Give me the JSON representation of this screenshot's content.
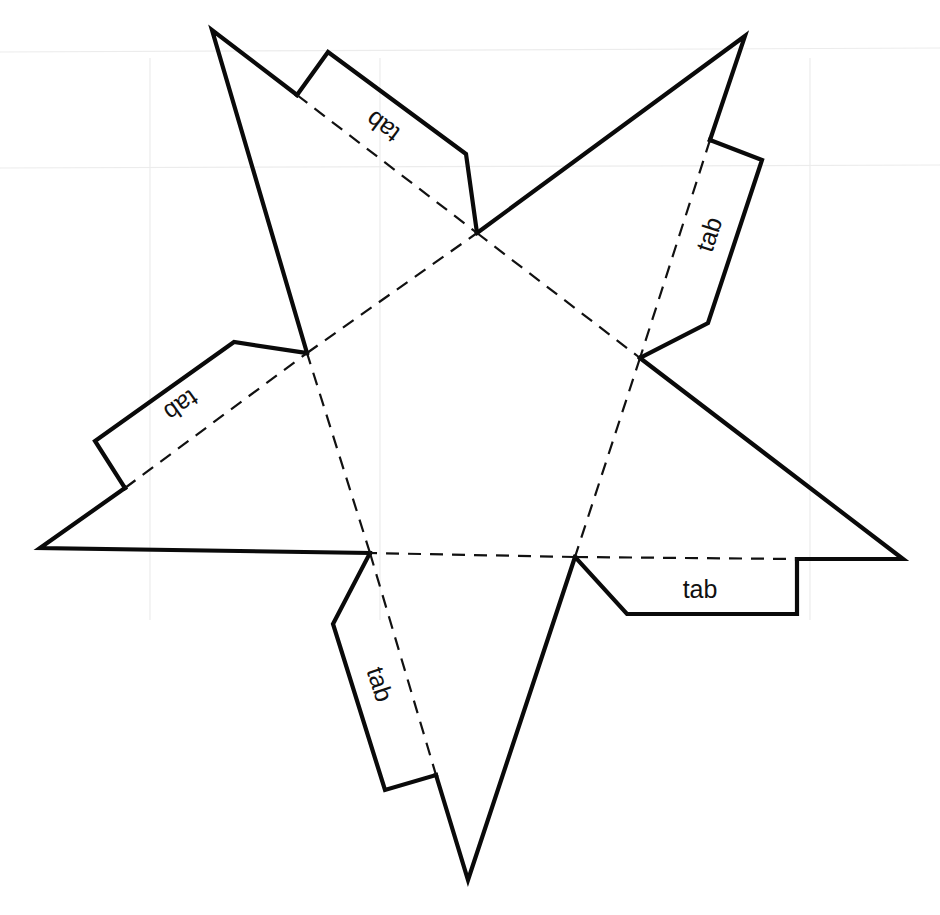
{
  "figure": {
    "shape": "pentagonal-pyramid-net",
    "base_faces": 1,
    "triangular_faces": 5,
    "cut_line_style": "solid",
    "fold_line_style": "dashed",
    "colors": {
      "line": "#0a0a0a",
      "background": "#ffffff"
    }
  },
  "tabs": [
    {
      "id": "top-left",
      "label": "tab"
    },
    {
      "id": "right",
      "label": "tab"
    },
    {
      "id": "left",
      "label": "tab"
    },
    {
      "id": "bottom-left",
      "label": "tab"
    },
    {
      "id": "bottom-right",
      "label": "tab"
    }
  ]
}
